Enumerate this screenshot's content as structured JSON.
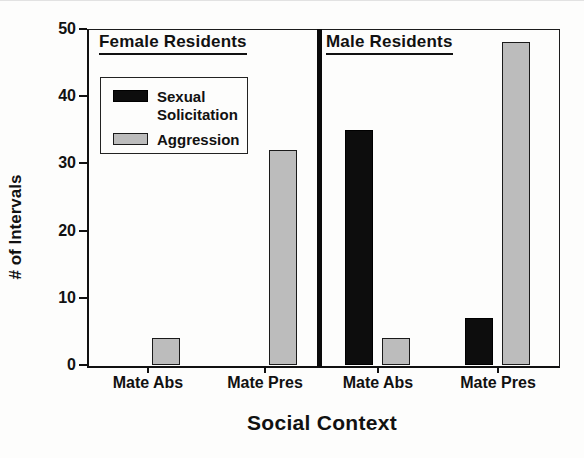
{
  "figure": {
    "y_axis_title": "# of Intervals",
    "x_axis_title": "Social Context",
    "panels": [
      {
        "title": "Female Residents"
      },
      {
        "title": "Male Residents"
      }
    ],
    "legend": {
      "items": [
        {
          "label": "Sexual Solicitation",
          "swatch": "black-solid"
        },
        {
          "label": "Aggression",
          "swatch": "gray-stipple"
        }
      ]
    }
  },
  "chart_data": {
    "type": "bar",
    "title": "",
    "xlabel": "Social Context",
    "ylabel": "# of Intervals",
    "ylim": [
      0,
      50
    ],
    "yticks": [
      0,
      10,
      20,
      30,
      40,
      50
    ],
    "grid": false,
    "legend_position": "upper-left-inside",
    "panels": [
      "Female Residents",
      "Male Residents"
    ],
    "categories": [
      "Mate Abs",
      "Mate Pres",
      "Mate Abs",
      "Mate Pres"
    ],
    "groups": [
      {
        "panel": "Female Residents",
        "category": "Mate Abs",
        "sexual_solicitation": 0,
        "aggression": 4
      },
      {
        "panel": "Female Residents",
        "category": "Mate Pres",
        "sexual_solicitation": 0,
        "aggression": 32
      },
      {
        "panel": "Male Residents",
        "category": "Mate Abs",
        "sexual_solicitation": 35,
        "aggression": 4
      },
      {
        "panel": "Male Residents",
        "category": "Mate Pres",
        "sexual_solicitation": 7,
        "aggression": 48
      }
    ],
    "series": [
      {
        "name": "Sexual Solicitation",
        "values": [
          0,
          0,
          35,
          7
        ],
        "color": "#0d0d0d"
      },
      {
        "name": "Aggression",
        "values": [
          4,
          32,
          4,
          48
        ],
        "color": "#bcbcbc"
      }
    ]
  }
}
